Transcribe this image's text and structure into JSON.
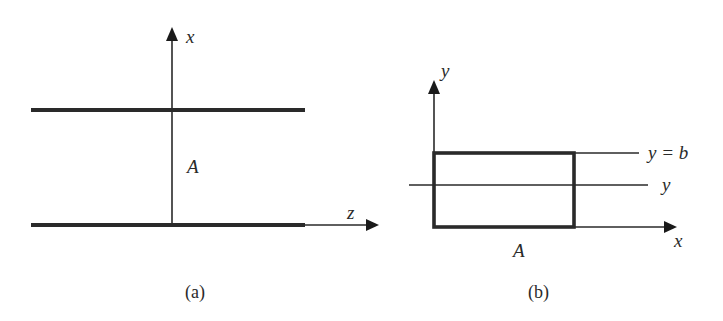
{
  "colors": {
    "stroke": "#2a2a2a",
    "background": "#ffffff"
  },
  "panel_a": {
    "caption": "(a)",
    "vertical_axis_label": "x",
    "horizontal_axis_label": "z",
    "region_label": "A"
  },
  "panel_b": {
    "caption": "(b)",
    "vertical_axis_label": "y",
    "horizontal_axis_label": "x",
    "region_label": "A",
    "upper_line_label": "y = b",
    "middle_line_label": "y"
  }
}
